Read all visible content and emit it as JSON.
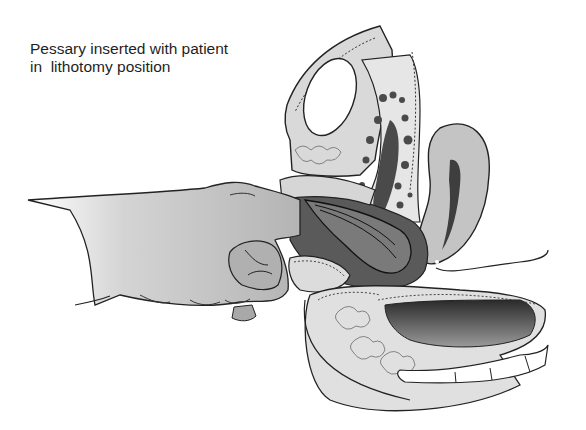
{
  "figure": {
    "caption_lines": [
      "Pessary inserted with patient",
      "in  lithotomy position"
    ],
    "structures": [
      "hand-fingers",
      "pubic-symphysis",
      "bladder",
      "uterus",
      "vagina",
      "pessary",
      "rectum",
      "sacrum-coccyx",
      "perineum"
    ]
  },
  "colors": {
    "background": "#ffffff",
    "line": "#222222",
    "light_tissue": "#d9d9d9",
    "mid_tissue": "#b5b5b5",
    "dark_tissue": "#4a4a4a",
    "hand": "#c8c8c8"
  }
}
